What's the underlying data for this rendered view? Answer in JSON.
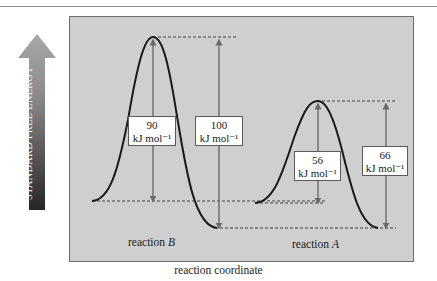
{
  "figure": {
    "y_axis_label": "STANDARD FREE ENERGY",
    "x_axis_label": "reaction coordinate",
    "reactions": [
      {
        "id": "B",
        "label_prefix": "reaction ",
        "label_italic": "B",
        "activation_energy": {
          "value": "90",
          "unit": "kJ mol⁻¹"
        },
        "total_barrier_from_product": {
          "value": "100",
          "unit": "kJ mol⁻¹"
        }
      },
      {
        "id": "A",
        "label_prefix": "reaction ",
        "label_italic": "A",
        "activation_energy": {
          "value": "56",
          "unit": "kJ mol⁻¹"
        },
        "total_barrier_from_product": {
          "value": "66",
          "unit": "kJ mol⁻¹"
        }
      }
    ],
    "colors": {
      "panel_background": "#cfcfcf",
      "curve": "#1a1a1a",
      "arrows": "#6a6a6a",
      "dashed": "#333333",
      "axis_arrow_top": "#9a9a9a",
      "axis_arrow_bottom": "#2a2a2a"
    }
  }
}
